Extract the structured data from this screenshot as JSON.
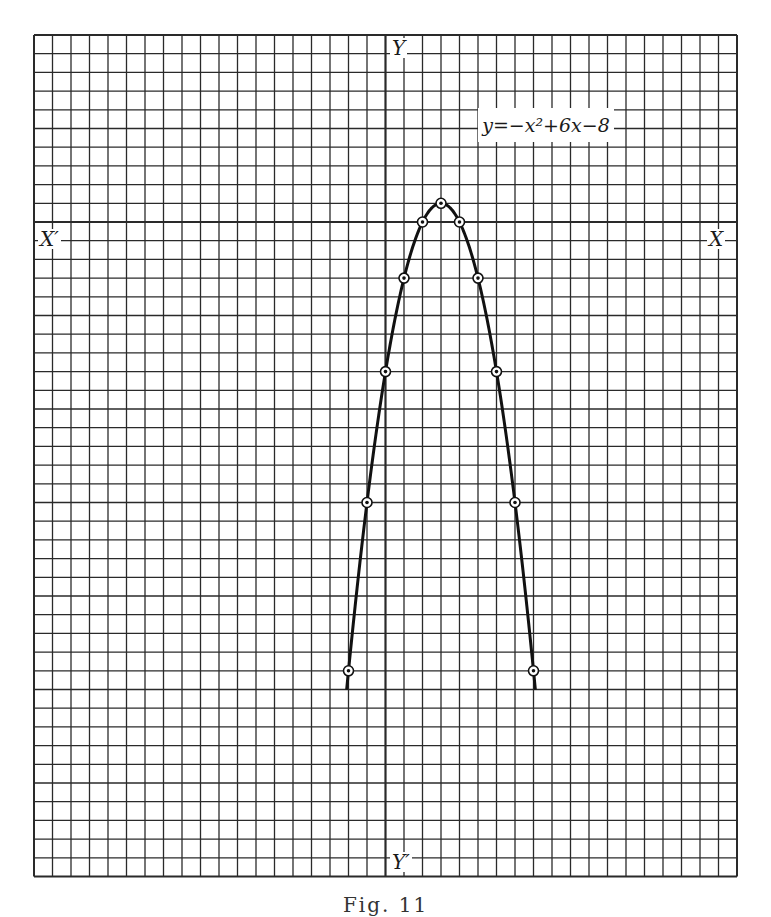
{
  "chart_data": {
    "type": "line",
    "equation": "y=−x²+6x−8",
    "xlabel": "X",
    "xlabel_neg": "X′",
    "ylabel": "Y",
    "ylabel_neg": "Y′",
    "caption": "Fig. 11",
    "grid": true,
    "unit_per_cell": 1,
    "xlim": [
      -19,
      19
    ],
    "ylim": [
      -35,
      10
    ],
    "series": [
      {
        "name": "y = -x^2 + 6x - 8",
        "x": [
          -2,
          -1,
          0,
          1,
          2,
          3,
          4,
          5,
          6,
          7,
          8
        ],
        "y": [
          -24,
          -15,
          -8,
          -3,
          0,
          1,
          0,
          -3,
          -8,
          -15,
          -24
        ]
      }
    ],
    "curve_x_range": [
      -2.1,
      8.1
    ]
  },
  "layout": {
    "grid_left": 34,
    "grid_top": 35,
    "cell_w": 18.5,
    "cell_h": 18.7,
    "cols": 38,
    "rows": 45,
    "y_axis_col": 19,
    "x_axis_row": 10
  }
}
